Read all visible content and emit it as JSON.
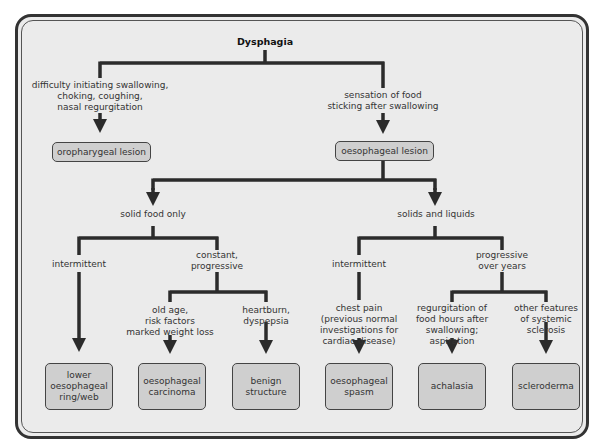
{
  "diagram": {
    "title": "Dysphagia",
    "branch_left": {
      "text_lines": [
        "difficulty initiating swallowing,",
        "choking, coughing,",
        "nasal regurgitation"
      ],
      "outcome": "oropharygeal lesion"
    },
    "branch_right": {
      "text_lines": [
        "sensation of food",
        "sticking after swallowing"
      ],
      "outcome": "oesophageal lesion"
    },
    "solid_food_only": {
      "label": "solid food only",
      "intermittent": {
        "label": "intermittent",
        "outcome_lines": [
          "lower",
          "oesophageal",
          "ring/web"
        ]
      },
      "constant": {
        "label_lines": [
          "constant,",
          "progressive"
        ],
        "old_age": {
          "text_lines": [
            "old age,",
            "risk factors",
            "marked weight loss"
          ],
          "outcome_lines": [
            "oesophageal",
            "carcinoma"
          ]
        },
        "heartburn": {
          "text_lines": [
            "heartburn,",
            "dyspepsia"
          ],
          "outcome_lines": [
            "benign",
            "structure"
          ]
        }
      }
    },
    "solids_and_liquids": {
      "label": "solids and liquids",
      "intermittent": {
        "label": "intermittent",
        "text_lines": [
          "chest pain",
          "(previous normal",
          "investigations for",
          "cardiac disease)"
        ],
        "outcome_lines": [
          "oesophageal",
          "spasm"
        ]
      },
      "progressive": {
        "label_lines": [
          "progressive",
          "over years"
        ],
        "regurgitation": {
          "text_lines": [
            "regurgitation of",
            "food hours after",
            "swallowing;",
            "aspiration"
          ],
          "outcome": "achalasia"
        },
        "systemic": {
          "text_lines": [
            "other features",
            "of systemic",
            "sclerosis"
          ],
          "outcome": "scleroderma"
        }
      }
    }
  },
  "colors": {
    "background": "#ebebeb",
    "box_fill": "#cfcfcf",
    "line": "#2b2b2b",
    "border": "#333333"
  }
}
